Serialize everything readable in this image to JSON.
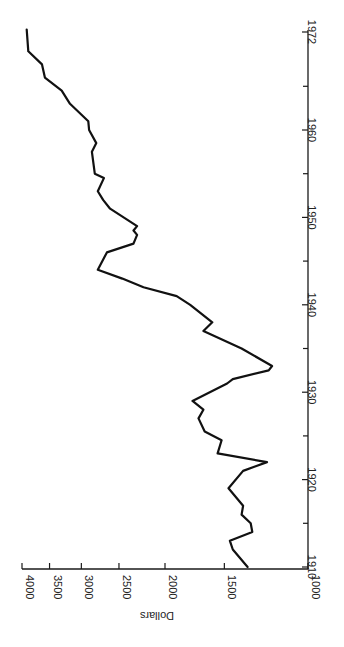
{
  "chart_data": {
    "type": "line",
    "title": "",
    "orientation": "rotated-90-ccw",
    "xlabel": "",
    "ylabel": "Dollars",
    "y_scale": "log",
    "ylim": [
      1000,
      4000
    ],
    "xlim": [
      1910,
      1972
    ],
    "x_ticks": [
      1910,
      1920,
      1930,
      1940,
      1950,
      1960,
      1972
    ],
    "x_minor_ticks": [
      1915,
      1925,
      1935,
      1945,
      1955,
      1965
    ],
    "y_ticks": [
      1000,
      1500,
      2000,
      2500,
      3000,
      3500,
      4000
    ],
    "grid": false,
    "legend": null,
    "series": [
      {
        "name": "Dollars",
        "color": "#111111",
        "points": [
          {
            "x": 1910,
            "y": 1340
          },
          {
            "x": 1912,
            "y": 1440
          },
          {
            "x": 1913,
            "y": 1460
          },
          {
            "x": 1914,
            "y": 1310
          },
          {
            "x": 1915,
            "y": 1320
          },
          {
            "x": 1916,
            "y": 1380
          },
          {
            "x": 1917,
            "y": 1370
          },
          {
            "x": 1919,
            "y": 1470
          },
          {
            "x": 1921,
            "y": 1370
          },
          {
            "x": 1922,
            "y": 1220
          },
          {
            "x": 1923,
            "y": 1550
          },
          {
            "x": 1924.5,
            "y": 1520
          },
          {
            "x": 1925.5,
            "y": 1650
          },
          {
            "x": 1927,
            "y": 1700
          },
          {
            "x": 1928,
            "y": 1660
          },
          {
            "x": 1929,
            "y": 1750
          },
          {
            "x": 1931,
            "y": 1480
          },
          {
            "x": 1931.5,
            "y": 1440
          },
          {
            "x": 1932.5,
            "y": 1210
          },
          {
            "x": 1933,
            "y": 1190
          },
          {
            "x": 1935,
            "y": 1380
          },
          {
            "x": 1937,
            "y": 1660
          },
          {
            "x": 1938,
            "y": 1590
          },
          {
            "x": 1940,
            "y": 1770
          },
          {
            "x": 1941,
            "y": 1890
          },
          {
            "x": 1942,
            "y": 2220
          },
          {
            "x": 1943,
            "y": 2460
          },
          {
            "x": 1944,
            "y": 2770
          },
          {
            "x": 1946,
            "y": 2650
          },
          {
            "x": 1947,
            "y": 2330
          },
          {
            "x": 1948,
            "y": 2290
          },
          {
            "x": 1948.5,
            "y": 2330
          },
          {
            "x": 1949,
            "y": 2290
          },
          {
            "x": 1951,
            "y": 2610
          },
          {
            "x": 1952,
            "y": 2700
          },
          {
            "x": 1953,
            "y": 2770
          },
          {
            "x": 1954.5,
            "y": 2690
          },
          {
            "x": 1955,
            "y": 2810
          },
          {
            "x": 1957.5,
            "y": 2850
          },
          {
            "x": 1958.5,
            "y": 2790
          },
          {
            "x": 1960,
            "y": 2890
          },
          {
            "x": 1961,
            "y": 2900
          },
          {
            "x": 1963,
            "y": 3170
          },
          {
            "x": 1964.5,
            "y": 3300
          },
          {
            "x": 1966,
            "y": 3580
          },
          {
            "x": 1967.5,
            "y": 3630
          },
          {
            "x": 1969,
            "y": 3880
          },
          {
            "x": 1971.5,
            "y": 3910
          }
        ]
      }
    ]
  },
  "labels": {
    "y_axis_title": "Dollars",
    "y_tick_labels": [
      "1000",
      "1500",
      "2000",
      "2500",
      "3000",
      "3500",
      "4000"
    ],
    "x_tick_labels": [
      "1910",
      "1920",
      "1930",
      "1940",
      "1950",
      "1960",
      "1972"
    ]
  }
}
